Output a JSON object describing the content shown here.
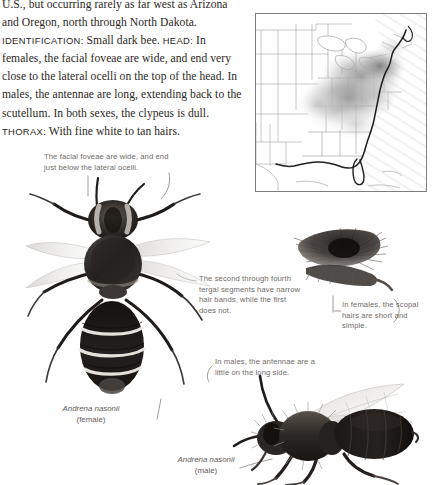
{
  "page": {
    "clipped_top_line": "differentiated from other species in the eastern",
    "body_paragraphs": [
      {
        "runs": [
          {
            "style": "normal",
            "text": "U.S., but occurring rarely as far west as Arizona and Oregon, north through North Dakota. "
          },
          {
            "style": "smallcaps",
            "text": "Identification:"
          },
          {
            "style": "normal",
            "text": " Small dark bee. "
          },
          {
            "style": "smallcaps",
            "text": "Head:"
          },
          {
            "style": "normal",
            "text": " In females, the facial foveae are wide, and end very close to the lateral ocelli on the top of the head. In males, the antennae are long, extending back to the scutellum. In both sexes, the clypeus is dull. "
          },
          {
            "style": "smallcaps",
            "text": "Thorax:"
          },
          {
            "style": "normal",
            "text": " With fine white to tan hairs."
          }
        ]
      }
    ],
    "body_plain": "U.S., but occurring rarely as far west as Arizona and Oregon, north through North Dakota. IDENTIFICATION: Small dark bee. HEAD: In females, the facial foveae are wide, and end very close to the lateral ocelli on the top of the head. In males, the antennae are long, extending back to the scutellum. In both sexes, the clypeus is dull. THORAX: With fine white to tan hairs."
  },
  "map": {
    "caption": "",
    "region": "Eastern United States distribution map",
    "shading_color": "#9a9a9a",
    "border_color": "#7d7d7d",
    "water_color": "#ffffff",
    "land_color": "#ffffff"
  },
  "annotations": [
    {
      "id": "facial-foveae",
      "text": "The facial foveae are wide, and end just below the lateral ocelli."
    },
    {
      "id": "tergal-segments",
      "text": "The second through fourth tergal segments have narrow hair bands, while the first does not."
    },
    {
      "id": "scopal-hairs",
      "text": "In females, the scopal hairs are short and simple."
    },
    {
      "id": "male-antennae",
      "text": "In males, the antennae are a little on the long side."
    }
  ],
  "specimens": [
    {
      "id": "female",
      "species": "Andrena nasonii",
      "sex": "(female)",
      "view": "dorsal"
    },
    {
      "id": "scopa",
      "species": "",
      "sex": "",
      "view": "hind leg scopa detail"
    },
    {
      "id": "male",
      "species": "Andrena nasonii",
      "sex": "(male)",
      "view": "lateral"
    }
  ],
  "colors": {
    "text": "#2b2724",
    "annotation": "#6e6a67",
    "caption": "#5f5b58",
    "specimen_dark": "#1c1a18",
    "specimen_mid": "#6d6763",
    "background": "#ffffff"
  }
}
